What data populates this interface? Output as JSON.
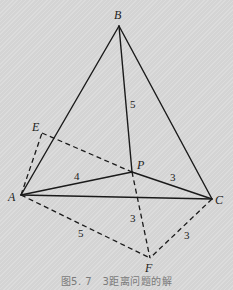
{
  "points": {
    "B": {
      "label": "B",
      "x": 119,
      "y": 26,
      "lx": 115,
      "ly": 19
    },
    "E": {
      "label": "E",
      "x": 42,
      "y": 133,
      "lx": 33,
      "ly": 130
    },
    "A": {
      "label": "A",
      "x": 21,
      "y": 195,
      "lx": 9,
      "ly": 200
    },
    "P": {
      "label": "P",
      "x": 132,
      "y": 172,
      "lx": 137,
      "ly": 168
    },
    "C": {
      "label": "C",
      "x": 212,
      "y": 199,
      "lx": 215,
      "ly": 203
    },
    "F": {
      "label": "F",
      "x": 150,
      "y": 258,
      "lx": 145,
      "ly": 271
    }
  },
  "solid_segments": [
    [
      "B",
      "A"
    ],
    [
      "B",
      "C"
    ],
    [
      "B",
      "P"
    ],
    [
      "A",
      "P"
    ],
    [
      "P",
      "C"
    ],
    [
      "A",
      "C"
    ]
  ],
  "dashed_segments": [
    [
      "A",
      "E"
    ],
    [
      "E",
      "P"
    ],
    [
      "P",
      "F"
    ],
    [
      "A",
      "F"
    ],
    [
      "C",
      "F"
    ]
  ],
  "length_labels": [
    {
      "segment": "BP",
      "text": "5",
      "x": 130,
      "y": 108
    },
    {
      "segment": "AP",
      "text": "4",
      "x": 74,
      "y": 180
    },
    {
      "segment": "PC",
      "text": "3",
      "x": 170,
      "y": 181
    },
    {
      "segment": "PF",
      "text": "3",
      "x": 130,
      "y": 222
    },
    {
      "segment": "AF",
      "text": "5",
      "x": 78,
      "y": 237
    },
    {
      "segment": "CF",
      "text": "3",
      "x": 184,
      "y": 239
    }
  ],
  "caption": "图5. 7　3距离问题的解"
}
